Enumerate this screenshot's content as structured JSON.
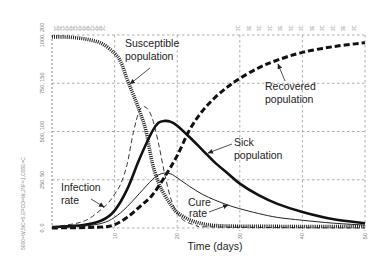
{
  "chart_data": {
    "type": "line",
    "title": "",
    "xlabel": "Time (days)",
    "ylabel": "",
    "xlim": [
      0,
      50
    ],
    "ylim_population": [
      0,
      1000
    ],
    "ylim_rate": [
      0,
      200
    ],
    "grid": true,
    "legend": "none (curves labeled inline with arrows)",
    "x_ticks": [
      10,
      20,
      30,
      40,
      50
    ],
    "x_tick_labels": [
      "10",
      "20",
      "30",
      "40",
      "50"
    ],
    "y_ticks_population": [
      0,
      250,
      500,
      750,
      1000
    ],
    "y_ticks_rate": [
      0,
      50,
      100,
      150,
      200
    ],
    "y_tick_labels": [
      "0, 0",
      "250, 50",
      "500, 100",
      "750, 150",
      "1000, 200"
    ],
    "series": [
      {
        "name": "Susceptible population",
        "axis": "population",
        "style": "heavy-dotted",
        "points": [
          [
            0,
            990
          ],
          [
            2,
            990
          ],
          [
            4,
            985
          ],
          [
            6,
            975
          ],
          [
            8,
            955
          ],
          [
            10,
            905
          ],
          [
            11,
            860
          ],
          [
            12,
            770
          ],
          [
            13,
            690
          ],
          [
            14,
            605
          ],
          [
            15,
            505
          ],
          [
            16,
            340
          ],
          [
            17,
            235
          ],
          [
            18,
            170
          ],
          [
            19,
            120
          ],
          [
            20,
            80
          ],
          [
            22,
            42
          ],
          [
            24,
            22
          ],
          [
            26,
            13
          ],
          [
            30,
            9
          ],
          [
            40,
            8
          ],
          [
            50,
            8
          ]
        ]
      },
      {
        "name": "Recovered population",
        "axis": "population",
        "style": "heavy-dashed",
        "points": [
          [
            0,
            0
          ],
          [
            8,
            5
          ],
          [
            10,
            18
          ],
          [
            12,
            55
          ],
          [
            14,
            110
          ],
          [
            16,
            170
          ],
          [
            18,
            265
          ],
          [
            20,
            375
          ],
          [
            22,
            510
          ],
          [
            24,
            605
          ],
          [
            26,
            675
          ],
          [
            28,
            730
          ],
          [
            30,
            775
          ],
          [
            33,
            830
          ],
          [
            36,
            870
          ],
          [
            40,
            910
          ],
          [
            45,
            940
          ],
          [
            50,
            960
          ]
        ]
      },
      {
        "name": "Sick population",
        "axis": "population",
        "style": "heavy-solid",
        "points": [
          [
            0,
            5
          ],
          [
            5,
            15
          ],
          [
            8,
            40
          ],
          [
            10,
            90
          ],
          [
            12,
            200
          ],
          [
            14,
            360
          ],
          [
            16,
            500
          ],
          [
            17,
            545
          ],
          [
            18,
            555
          ],
          [
            19,
            550
          ],
          [
            20,
            530
          ],
          [
            22,
            470
          ],
          [
            24,
            405
          ],
          [
            26,
            340
          ],
          [
            28,
            285
          ],
          [
            30,
            230
          ],
          [
            33,
            170
          ],
          [
            36,
            125
          ],
          [
            40,
            83
          ],
          [
            45,
            45
          ],
          [
            50,
            25
          ]
        ]
      },
      {
        "name": "Infection rate",
        "axis": "rate",
        "style": "thin-dashed",
        "points": [
          [
            0,
            1
          ],
          [
            4,
            5
          ],
          [
            6,
            10
          ],
          [
            8,
            20
          ],
          [
            9,
            26
          ],
          [
            10,
            35
          ],
          [
            11,
            46
          ],
          [
            12,
            66
          ],
          [
            13,
            99
          ],
          [
            14,
            122
          ],
          [
            15,
            125
          ],
          [
            16,
            114
          ],
          [
            17,
            88
          ],
          [
            18,
            56
          ],
          [
            19,
            30
          ],
          [
            20,
            16
          ],
          [
            21,
            8
          ],
          [
            23,
            3
          ],
          [
            26,
            1
          ],
          [
            50,
            0
          ]
        ]
      },
      {
        "name": "Cure rate",
        "axis": "rate",
        "style": "thin-solid",
        "points": [
          [
            0,
            0.5
          ],
          [
            5,
            2
          ],
          [
            8,
            5
          ],
          [
            10,
            11
          ],
          [
            12,
            22
          ],
          [
            14,
            36
          ],
          [
            16,
            50
          ],
          [
            17,
            55
          ],
          [
            18,
            57
          ],
          [
            19,
            56
          ],
          [
            20,
            52
          ],
          [
            22,
            43
          ],
          [
            24,
            35
          ],
          [
            26,
            29
          ],
          [
            28,
            24
          ],
          [
            30,
            20
          ],
          [
            33,
            15
          ],
          [
            36,
            11
          ],
          [
            40,
            8
          ],
          [
            45,
            5
          ],
          [
            50,
            3
          ]
        ]
      }
    ],
    "annotations": {
      "susceptible": {
        "line1": "Susceptible",
        "line2": "population"
      },
      "recovered": {
        "line1": "Recovered",
        "line2": "population"
      },
      "sick": {
        "line1": "Sick",
        "line2": "population"
      },
      "infection": {
        "line1": "Infection",
        "line2": "rate"
      },
      "cure": {
        "line1": "Cure",
        "line2": "rate"
      }
    },
    "side_caption": "5000=W,5IC=5,EPCO=W,JNF=1,C08E=C",
    "top_tick_marks": [
      "3C",
      "3E",
      "3C",
      "3C",
      "3E",
      "3C",
      "3C",
      "3E",
      "3C",
      "3C",
      "3E",
      "3C"
    ]
  }
}
